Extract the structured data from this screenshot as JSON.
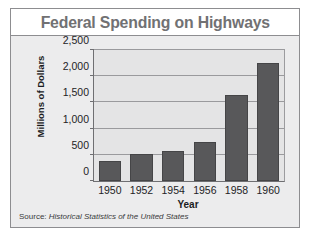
{
  "chart_data": {
    "type": "bar",
    "title": "Federal Spending on Highways",
    "xlabel": "Year",
    "ylabel": "Millions of Dollars",
    "categories": [
      "1950",
      "1952",
      "1954",
      "1956",
      "1958",
      "1960"
    ],
    "values": [
      380,
      520,
      570,
      750,
      1650,
      2250
    ],
    "ylim": [
      0,
      2500
    ],
    "yticks": [
      0,
      500,
      1000,
      1500,
      2000,
      2500
    ],
    "ytick_labels": [
      "0",
      "500",
      "1,000",
      "1,500",
      "2,000",
      "2,500"
    ],
    "grid": true,
    "legend": "none",
    "series": [
      {
        "name": "Federal Spending on Highways",
        "values": [
          380,
          520,
          570,
          750,
          1650,
          2250
        ]
      }
    ],
    "colors": {
      "bar": "#58585a",
      "title": "#717173",
      "plot_background": "#e4e4e5",
      "panel_background": "#ececed",
      "gridline": "#9a9a9d",
      "axis": "#6f6f72",
      "text": "#232325"
    }
  },
  "source": {
    "label": "Source:",
    "value": "Historical Statistics of the United States"
  }
}
